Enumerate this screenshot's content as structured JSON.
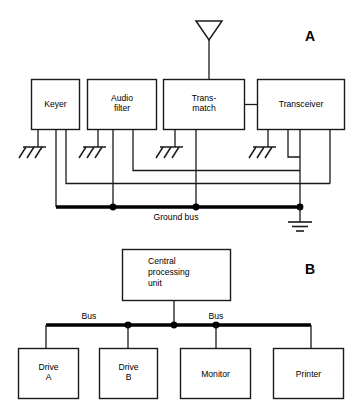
{
  "figure": {
    "panels": [
      {
        "id": "A",
        "letter": "A",
        "caption_text": "Ground bus",
        "antenna_label": "antenna",
        "blocks": [
          {
            "label": "Keyer",
            "lines": [
              "Keyer"
            ]
          },
          {
            "label": "Audio filter",
            "lines": [
              "Audio",
              "filter"
            ]
          },
          {
            "label": "Trans-match",
            "lines": [
              "Trans-",
              "match"
            ]
          },
          {
            "label": "Transceiver",
            "lines": [
              "Transceiver"
            ]
          }
        ],
        "ground_symbols": 4,
        "bus_nodes": 3,
        "earth_ground": "earth-ground"
      },
      {
        "id": "B",
        "letter": "B",
        "blocks": [
          {
            "label": "Central processing unit",
            "lines": [
              "Central",
              "processing",
              "unit"
            ]
          },
          {
            "label": "Drive A",
            "lines": [
              "Drive",
              "A"
            ]
          },
          {
            "label": "Drive B",
            "lines": [
              "Drive",
              "B"
            ]
          },
          {
            "label": "Monitor",
            "lines": [
              "Monitor"
            ]
          },
          {
            "label": "Printer",
            "lines": [
              "Printer"
            ]
          }
        ],
        "bus_labels": [
          "Bus",
          "Bus"
        ],
        "bus_nodes": 3
      }
    ]
  },
  "panel_a": {
    "letter": "A",
    "keyer": "Keyer",
    "audio_l1": "Audio",
    "audio_l2": "filter",
    "transmatch_l1": "Trans-",
    "transmatch_l2": "match",
    "transceiver": "Transceiver",
    "ground_bus": "Ground bus"
  },
  "panel_b": {
    "letter": "B",
    "cpu_l1": "Central",
    "cpu_l2": "processing",
    "cpu_l3": "unit",
    "drive_a_l1": "Drive",
    "drive_a_l2": "A",
    "drive_b_l1": "Drive",
    "drive_b_l2": "B",
    "monitor": "Monitor",
    "printer": "Printer",
    "bus_left": "Bus",
    "bus_right": "Bus"
  },
  "colors": {
    "line": "#1a1a1a",
    "bus": "#000000",
    "background": "#ffffff",
    "text": "#000000"
  }
}
